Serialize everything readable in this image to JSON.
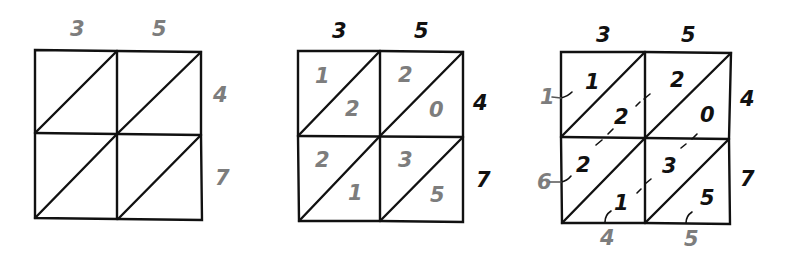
{
  "diagram": {
    "multiplicand_digits": [
      "3",
      "5"
    ],
    "multiplier_digits": [
      "4",
      "7"
    ],
    "colors": {
      "line": "#111111",
      "gray_digit": "#7d7d7d",
      "black_digit": "#111111"
    },
    "step1": {
      "top": [
        "3",
        "5"
      ],
      "right": [
        "4",
        "7"
      ]
    },
    "step2": {
      "top": [
        "3",
        "5"
      ],
      "right": [
        "4",
        "7"
      ],
      "cells": [
        {
          "row": 0,
          "col": 0,
          "tens": "1",
          "ones": "2"
        },
        {
          "row": 0,
          "col": 1,
          "tens": "2",
          "ones": "0"
        },
        {
          "row": 1,
          "col": 0,
          "tens": "2",
          "ones": "1"
        },
        {
          "row": 1,
          "col": 1,
          "tens": "3",
          "ones": "5"
        }
      ]
    },
    "step3": {
      "top": [
        "3",
        "5"
      ],
      "right": [
        "4",
        "7"
      ],
      "cells": [
        {
          "row": 0,
          "col": 0,
          "tens": "1",
          "ones": "2"
        },
        {
          "row": 0,
          "col": 1,
          "tens": "2",
          "ones": "0"
        },
        {
          "row": 1,
          "col": 0,
          "tens": "2",
          "ones": "1"
        },
        {
          "row": 1,
          "col": 1,
          "tens": "3",
          "ones": "5"
        }
      ],
      "left_sums": [
        "1",
        "6"
      ],
      "bottom_sums": [
        "4",
        "5"
      ],
      "product": "1645"
    }
  }
}
